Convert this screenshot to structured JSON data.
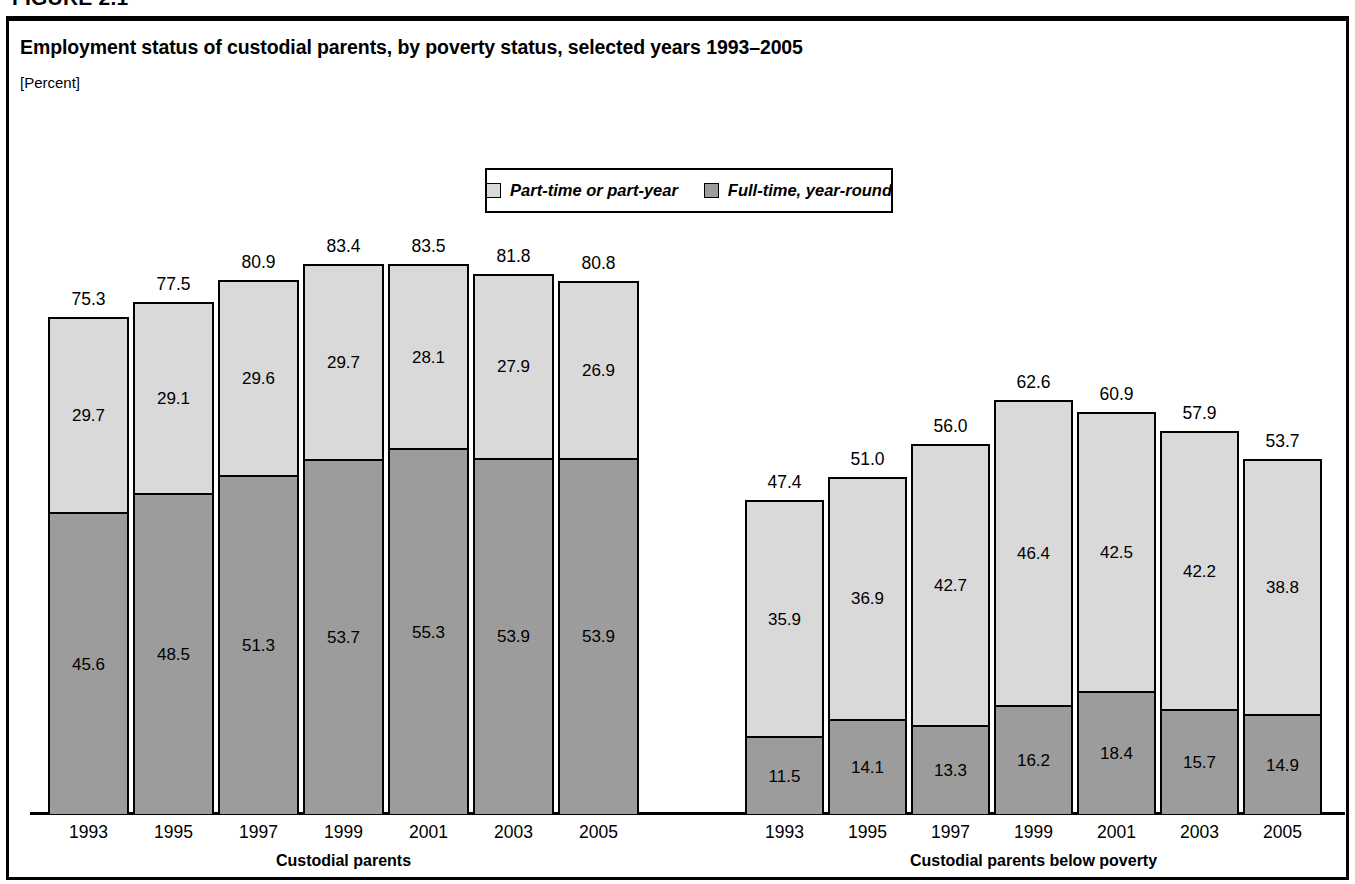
{
  "figure": {
    "number": "FIGURE 2.1",
    "title": "Employment status of custodial parents, by poverty status, selected years 1993–2005",
    "subtitle": "[Percent]"
  },
  "legend": {
    "entries": [
      {
        "label": "Part-time or part-year",
        "color": "#d9d9d9",
        "key": "part_time"
      },
      {
        "label": "Full-time, year-round",
        "color": "#9c9c9c",
        "key": "full_time"
      }
    ]
  },
  "colors": {
    "part_time": "#d9d9d9",
    "full_time": "#9c9c9c",
    "outline": "#000000",
    "background": "#ffffff"
  },
  "chart_data": {
    "type": "bar",
    "stacked": true,
    "title": "Employment status of custodial parents, by poverty status, selected years 1993–2005",
    "subtitle": "[Percent]",
    "xlabel": "",
    "ylabel": "Percent",
    "ylim": [
      0,
      100
    ],
    "grid": false,
    "legend_position": "top-center",
    "categories": [
      "1993",
      "1995",
      "1997",
      "1999",
      "2001",
      "2003",
      "2005"
    ],
    "groups": [
      {
        "name": "Custodial parents",
        "label": "Custodial parents",
        "series": [
          {
            "name": "Full-time, year-round",
            "key": "full_time",
            "values": [
              45.6,
              48.5,
              51.3,
              53.7,
              55.3,
              53.9,
              53.9
            ]
          },
          {
            "name": "Part-time or part-year",
            "key": "part_time",
            "values": [
              29.7,
              29.1,
              29.6,
              29.7,
              28.1,
              27.9,
              26.9
            ]
          }
        ],
        "totals": [
          75.3,
          77.5,
          80.9,
          83.4,
          83.5,
          81.8,
          80.8
        ]
      },
      {
        "name": "Custodial parents below poverty",
        "label": "Custodial parents below poverty",
        "series": [
          {
            "name": "Full-time, year-round",
            "key": "full_time",
            "values": [
              11.5,
              14.1,
              13.3,
              16.2,
              18.4,
              15.7,
              14.9
            ]
          },
          {
            "name": "Part-time or part-year",
            "key": "part_time",
            "values": [
              35.9,
              36.9,
              42.7,
              46.4,
              42.5,
              42.2,
              38.8
            ]
          }
        ],
        "totals": [
          47.4,
          51.0,
          56.0,
          62.6,
          60.9,
          57.9,
          53.7
        ]
      }
    ]
  },
  "layout": {
    "baseline_y": 812,
    "px_per_unit": 6.575,
    "groups_px": [
      {
        "start": 48,
        "bar_width": 81,
        "gap": 4
      },
      {
        "start": 745,
        "bar_width": 79,
        "gap": 4
      }
    ]
  }
}
